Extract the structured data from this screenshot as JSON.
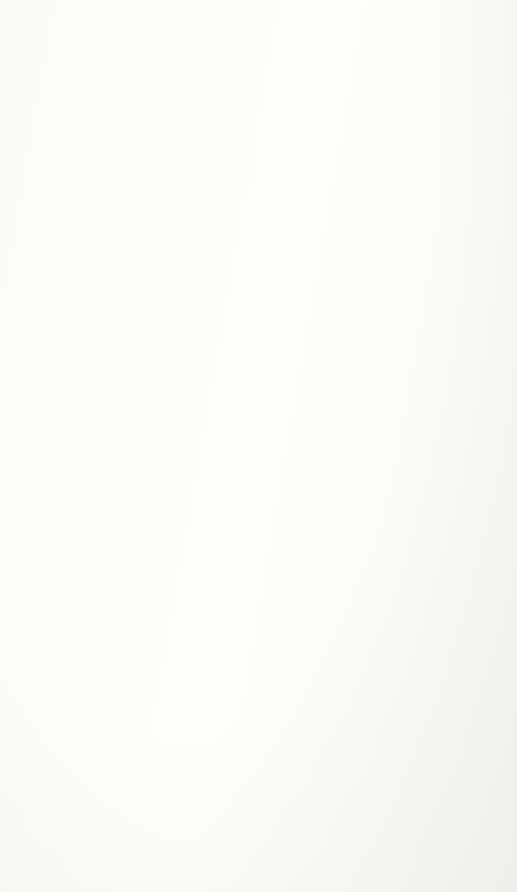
{
  "document": {
    "caption": "Comparison of 2009 versus 2013 federal disbursements in billions of dollars, as a percentage of total disbursements."
  },
  "chart_data": [
    {
      "type": "pie",
      "id": "federal-expenditure-2013",
      "title": "Federal Expenditure Distribution",
      "subtitle": "(total = $3,653 billion in 2013)",
      "year": "2013",
      "total_billions": 3653,
      "unit": "billions of dollars",
      "legend": "none",
      "categories": [
        "Non-defense discretionary",
        "Defense",
        "Social Security",
        "Other mandatory",
        "Interest",
        "Medicaid and CHIP",
        "Medicare"
      ],
      "values": [
        545,
        667,
        820,
        554,
        246,
        293,
        528
      ],
      "percentages": [
        14.9,
        18.3,
        22.4,
        15.2,
        6.7,
        8.0,
        14.5
      ],
      "colors": [
        "#8064a2",
        "#f79646",
        "#fbf43c",
        "#c7c7ba",
        "#4a7ebb",
        "#a33e2e",
        "#8ec044"
      ],
      "labels": [
        "Non-defense\ndiscretionary,\n$545, 14.9%",
        "Defense, $667,\n18.3%",
        "Social Security,\n$820, 22.4%",
        "Other\nmandatory,\n$554, 15.2%",
        "Interest, $246,\n6.7%",
        "Medicaid and\nCHIP, $293,\n8.0%",
        "Medicare, $528,\n14.5%"
      ]
    },
    {
      "type": "pie",
      "id": "federal-expenditure-2009",
      "title": "Federal Expenditure Distribution",
      "subtitle": "(total = $3,518 billion in 2009)",
      "year": "2009",
      "total_billions": 3518,
      "unit": "billions of dollars",
      "legend": "none",
      "categories": [
        "Non-defense discretionary",
        "Defense",
        "Social Security",
        "Other mandatory",
        "Interest",
        "Medicaid and CHIP",
        "Medicare"
      ],
      "values": [
        562,
        657,
        678,
        751,
        187,
        258,
        425
      ],
      "percentages": [
        16.0,
        18.7,
        19.3,
        21.3,
        5.3,
        7.3,
        12.1
      ],
      "colors": [
        "#8064a2",
        "#f79646",
        "#fbf43c",
        "#c7c7ba",
        "#4a7ebb",
        "#a33e2e",
        "#8ec044"
      ],
      "labels": [
        "Non-defense\ndiscretionary,\n$562, 16.0%",
        "Defense, $657,\n18.7%",
        "Social Security,\n$678, 19.3%",
        "Other\nmandatory,\n$751, 21.3%",
        "Interest,\n$187, 5.3%",
        "Medicaid and\nCHIP, $258,\n7.3%",
        "Medicare, $425,\n12.1%"
      ]
    }
  ]
}
